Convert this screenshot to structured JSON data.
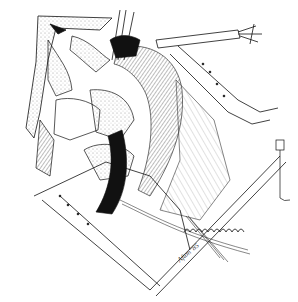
{
  "figure": {
    "type": "surgical line illustration",
    "style": "black ink on white, stippled and hatched shading",
    "background_color": "#ffffff",
    "ink_color": "#111111",
    "elements": [
      "retractor-blade-upper-left",
      "retractor-blade-lower",
      "retractor-blade-right",
      "ribbed-tubular-structure",
      "tissue-flaps",
      "instrument-shaft-upper-right",
      "comb-retractor-lower-right",
      "sutures-lower-right",
      "small-clip-instrument-right"
    ],
    "signature": "Afton '85"
  }
}
